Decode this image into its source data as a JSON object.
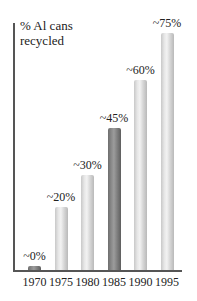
{
  "cut_text": "...recycled in the US...",
  "chart_data": {
    "type": "bar",
    "title": "",
    "ylabel": "% Al cans recycled",
    "xlabel": "",
    "categories": [
      "1970",
      "1975",
      "1980",
      "1985",
      "1990",
      "1995"
    ],
    "values": [
      0,
      20,
      30,
      45,
      60,
      75
    ],
    "value_labels": [
      "~0%",
      "~20%",
      "~30%",
      "~45%",
      "~60%",
      "~75%"
    ],
    "highlighted_category": "1985",
    "ylim": [
      0,
      80
    ],
    "grid": false,
    "legend": "none",
    "colors": {
      "bar": "#e0e0e0",
      "highlight": "#7f7f7f",
      "axis": "#555555"
    }
  },
  "chart": {
    "ylabel_line1": "% Al cans",
    "ylabel_line2": "recycled"
  }
}
